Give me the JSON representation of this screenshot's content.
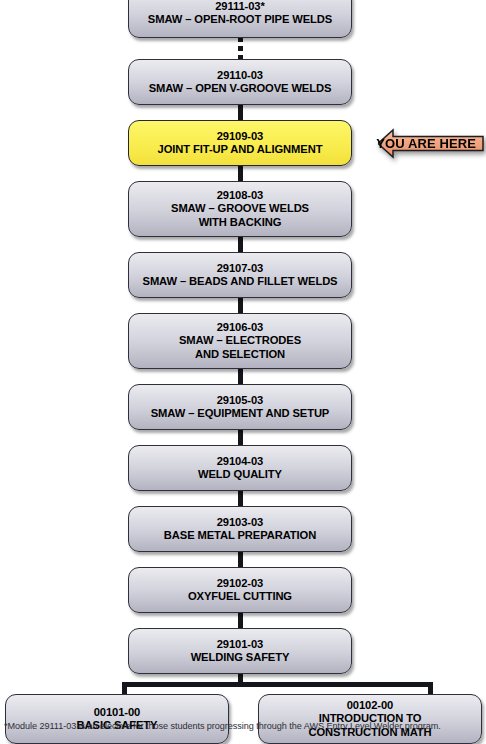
{
  "diagram": {
    "colors": {
      "box_fill_top": "#ECECEF",
      "box_fill_bottom": "#B2B2C0",
      "box_border": "#2E2E3C",
      "highlight_fill": "#FBF159",
      "callout_fill": "#F3A881",
      "connector": "#15151C",
      "text": "#000000"
    },
    "nodes": [
      {
        "id": "n29111",
        "code": "29111-03*",
        "lines": [
          "SMAW – OPEN-ROOT PIPE WELDS"
        ],
        "highlighted": false
      },
      {
        "id": "n29110",
        "code": "29110-03",
        "lines": [
          "SMAW – OPEN V-GROOVE WELDS"
        ],
        "highlighted": false
      },
      {
        "id": "n29109",
        "code": "29109-03",
        "lines": [
          "JOINT FIT-UP AND ALIGNMENT"
        ],
        "highlighted": true
      },
      {
        "id": "n29108",
        "code": "29108-03",
        "lines": [
          "SMAW – GROOVE WELDS",
          "WITH BACKING"
        ],
        "highlighted": false
      },
      {
        "id": "n29107",
        "code": "29107-03",
        "lines": [
          "SMAW – BEADS AND FILLET WELDS"
        ],
        "highlighted": false
      },
      {
        "id": "n29106",
        "code": "29106-03",
        "lines": [
          "SMAW – ELECTRODES",
          "AND SELECTION"
        ],
        "highlighted": false
      },
      {
        "id": "n29105",
        "code": "29105-03",
        "lines": [
          "SMAW – EQUIPMENT AND SETUP"
        ],
        "highlighted": false
      },
      {
        "id": "n29104",
        "code": "29104-03",
        "lines": [
          "WELD QUALITY"
        ],
        "highlighted": false
      },
      {
        "id": "n29103",
        "code": "29103-03",
        "lines": [
          "BASE METAL PREPARATION"
        ],
        "highlighted": false
      },
      {
        "id": "n29102",
        "code": "29102-03",
        "lines": [
          "OXYFUEL CUTTING"
        ],
        "highlighted": false
      },
      {
        "id": "n29101",
        "code": "29101-03",
        "lines": [
          "WELDING SAFETY"
        ],
        "highlighted": false
      },
      {
        "id": "n00101",
        "code": "00101-00",
        "lines": [
          "BASIC SAFETY"
        ],
        "highlighted": false
      },
      {
        "id": "n00102",
        "code": "00102-00",
        "lines": [
          "INTRODUCTION TO",
          "CONSTRUCTION MATH"
        ],
        "highlighted": false
      }
    ],
    "callout": {
      "label": "YOU ARE HERE",
      "points_to": "n29109",
      "direction": "left"
    },
    "footnote": "*Module 29111-03 is an elective for those students progressing through the AWS Entry Level Welder program."
  }
}
